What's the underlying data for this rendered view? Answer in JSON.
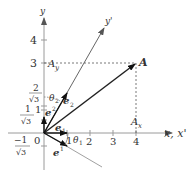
{
  "diagram": {
    "axes": {
      "x_label": "x, x'",
      "y_label": "y",
      "yprime_label": "y'",
      "origin_label": "0",
      "x_ticks": [
        "1",
        "2",
        "3",
        "4"
      ],
      "y_ticks": [
        "1",
        "3",
        "4"
      ],
      "y_frac_ticks": [
        {
          "num": "2",
          "den": "√3"
        },
        {
          "num": "1",
          "den": "√3"
        },
        {
          "num": "−1",
          "den": "√3"
        }
      ]
    },
    "point": {
      "label": "A",
      "coords": [
        4,
        3
      ]
    },
    "projections": {
      "ax_label": "A",
      "ax_sub": "x",
      "ay_label": "A",
      "ay_sub": "y"
    },
    "vectors": {
      "e1": {
        "base": "e",
        "sub": "1"
      },
      "e2": {
        "base": "e",
        "sub": "2"
      },
      "e_sup1": {
        "base": "e",
        "sup": "1"
      },
      "e_sup2": {
        "base": "e",
        "sup": "2"
      }
    },
    "angles": {
      "theta1": {
        "base": "θ",
        "sub": "1"
      },
      "theta2": {
        "base": "θ",
        "sub": "2"
      }
    },
    "colors": {
      "axis": "#999999",
      "vector": "#222222",
      "dotted": "#555555",
      "text": "#333333"
    }
  }
}
